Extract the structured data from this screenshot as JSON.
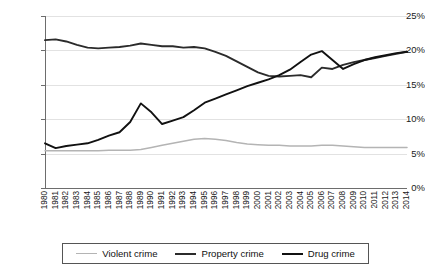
{
  "chart_data": {
    "type": "line",
    "title": "",
    "xlabel": "",
    "ylabel": "",
    "grid": true,
    "legend_position": "bottom",
    "ylim": [
      0,
      25
    ],
    "ytick_labels": [
      "0%",
      "5%",
      "10%",
      "15%",
      "20%",
      "25%"
    ],
    "ytick_values": [
      0,
      5,
      10,
      15,
      20,
      25
    ],
    "categories": [
      "1980",
      "1981",
      "1982",
      "1983",
      "1984",
      "1985",
      "1986",
      "1987",
      "1988",
      "1989",
      "1990",
      "1991",
      "1992",
      "1993",
      "1994",
      "1995",
      "1996",
      "1997",
      "1998",
      "1999",
      "2000",
      "2001",
      "2002",
      "2003",
      "2004",
      "2005",
      "2006",
      "2007",
      "2008",
      "2009",
      "2010",
      "2011",
      "2012",
      "2013",
      "2014"
    ],
    "series": [
      {
        "name": "Violent crime",
        "color": "#b4b4b4",
        "values": [
          5.4,
          5.4,
          5.4,
          5.4,
          5.4,
          5.4,
          5.5,
          5.5,
          5.5,
          5.6,
          5.9,
          6.2,
          6.5,
          6.8,
          7.1,
          7.2,
          7.1,
          6.9,
          6.6,
          6.4,
          6.3,
          6.2,
          6.2,
          6.1,
          6.1,
          6.1,
          6.2,
          6.2,
          6.1,
          6.0,
          5.9,
          5.9,
          5.9,
          5.9,
          5.9
        ]
      },
      {
        "name": "Property crime",
        "color": "#2b2b2b",
        "values": [
          21.5,
          21.6,
          21.3,
          20.8,
          20.4,
          20.3,
          20.4,
          20.5,
          20.7,
          21.0,
          20.8,
          20.6,
          20.6,
          20.4,
          20.5,
          20.3,
          19.8,
          19.2,
          18.4,
          17.6,
          16.8,
          16.3,
          16.2,
          16.3,
          16.4,
          16.1,
          17.5,
          17.3,
          17.9,
          18.3,
          18.6,
          18.9,
          19.2,
          19.5,
          19.8
        ]
      },
      {
        "name": "Drug crime",
        "color": "#111111",
        "values": [
          6.5,
          5.8,
          6.1,
          6.3,
          6.5,
          7.0,
          7.6,
          8.1,
          9.6,
          12.3,
          11.0,
          9.3,
          9.8,
          10.3,
          11.3,
          12.4,
          13.0,
          13.6,
          14.2,
          14.8,
          15.3,
          15.8,
          16.4,
          17.2,
          18.3,
          19.4,
          19.9,
          18.6,
          17.3,
          18.0,
          18.6,
          19.0,
          19.3,
          19.6,
          19.8
        ]
      }
    ]
  },
  "legend": {
    "items": [
      {
        "label": "Violent crime",
        "color": "#b4b4b4"
      },
      {
        "label": "Property crime",
        "color": "#2b2b2b"
      },
      {
        "label": "Drug crime",
        "color": "#111111"
      }
    ]
  }
}
